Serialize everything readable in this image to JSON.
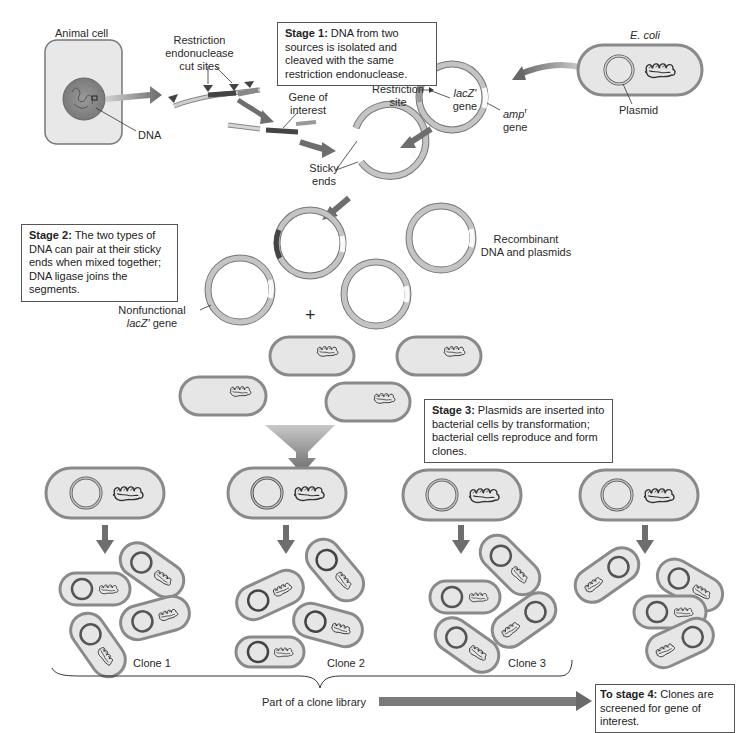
{
  "labels": {
    "animal_cell": "Animal cell",
    "dna": "DNA",
    "restriction_cut_sites": [
      "Restriction",
      "endonuclease",
      "cut sites"
    ],
    "gene_of_interest": [
      "Gene of",
      "interest"
    ],
    "restriction_site": [
      "Restriction",
      "site"
    ],
    "lacz_gene": [
      "lacZ'",
      "gene"
    ],
    "ampr_gene": [
      "amp",
      "r",
      "gene"
    ],
    "ecoli": "E. coli",
    "plasmid": "Plasmid",
    "sticky_ends": [
      "Sticky",
      "ends"
    ],
    "nonfunctional_lacz": [
      "Nonfunctional",
      "lacZ'",
      " gene"
    ],
    "recombinant": [
      "Recombinant",
      "DNA and plasmids"
    ],
    "plus": "+",
    "clone1": "Clone 1",
    "clone2": "Clone 2",
    "clone3": "Clone 3",
    "clone_library": "Part of a clone library"
  },
  "stages": {
    "stage1": {
      "title": "Stage 1:",
      "text": " DNA from two sources is isolated and cleaved with the same restriction endonuclease."
    },
    "stage2": {
      "title": "Stage 2:",
      "text": " The two types of DNA can pair at their sticky ends when mixed together; DNA ligase joins the segments."
    },
    "stage3": {
      "title": "Stage 3:",
      "text": " Plasmids are inserted into bacterial cells by transformation; bacterial cells reproduce and form clones."
    },
    "stage4": {
      "title": "To stage 4:",
      "text": " Clones are screened for gene of interest."
    }
  },
  "colors": {
    "cell_fill": "#e6e6e6",
    "cell_border": "#8a8a8a",
    "arrow": "#6e6e6e",
    "plasmid_ring": "#a8a8a8",
    "gene_dark": "#4a4a4a"
  }
}
